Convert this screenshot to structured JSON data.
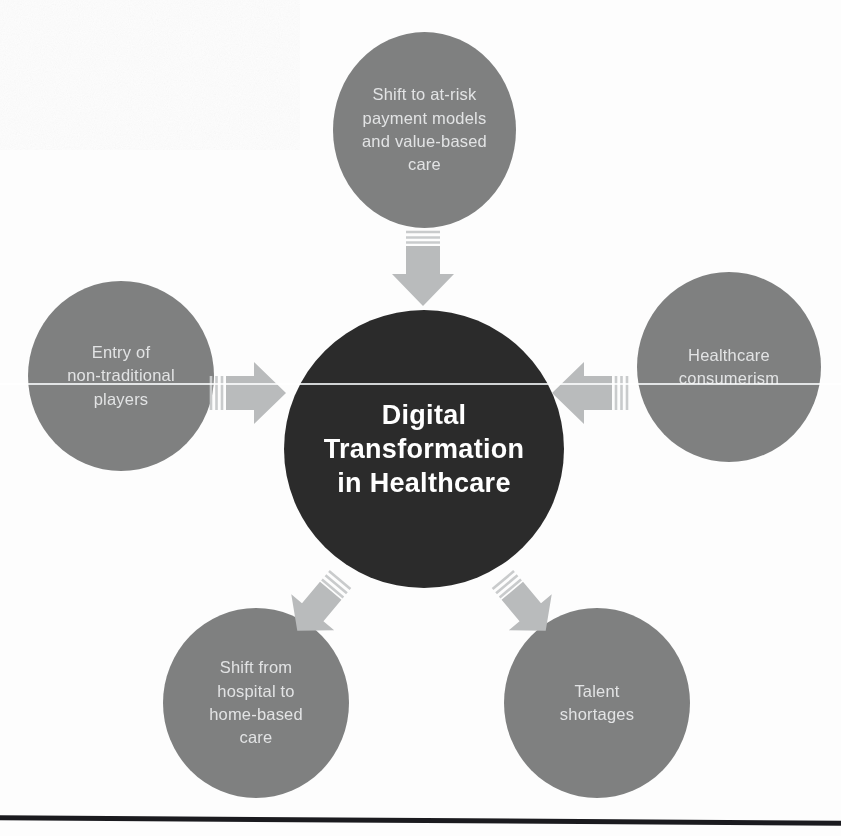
{
  "diagram": {
    "hub": {
      "name": "digital-transformation-hub",
      "label": "Digital\nTransformation\nin Healthcare",
      "color": "#2b2b2b",
      "text_color": "#ffffff"
    },
    "satellite_color": "#7f8080",
    "satellite_text_color": "#e2e3e4",
    "arrow_color": "#b9bbbc",
    "nodes": [
      {
        "id": "shift-to-at-risk-payment-models",
        "label": "Shift to at-risk\npayment models\nand value-based\ncare",
        "position": "top",
        "arrow_direction": "down"
      },
      {
        "id": "entry-of-non-traditional-players",
        "label": "Entry of\nnon-traditional\nplayers",
        "position": "left",
        "arrow_direction": "right"
      },
      {
        "id": "healthcare-consumerism",
        "label": "Healthcare\nconsumerism",
        "position": "right",
        "arrow_direction": "left"
      },
      {
        "id": "shift-from-hospital-to-home-based-care",
        "label": "Shift from\nhospital to\nhome-based\ncare",
        "position": "bottom-left",
        "arrow_direction": "up-right"
      },
      {
        "id": "talent-shortages",
        "label": "Talent\nshortages",
        "position": "bottom-right",
        "arrow_direction": "up-left"
      }
    ]
  }
}
